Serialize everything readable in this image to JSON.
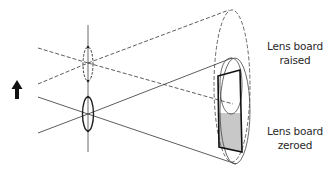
{
  "diagram": {
    "labels": {
      "raised_line1": "Lens board",
      "raised_line2": "raised",
      "zeroed_line1": "Lens board",
      "zeroed_line2": "zeroed"
    },
    "icons": {
      "movement_arrow": "arrow-up-icon"
    },
    "colors": {
      "line": "#333333",
      "shaded_area": "#c8c8c8",
      "background": "#ffffff"
    }
  }
}
